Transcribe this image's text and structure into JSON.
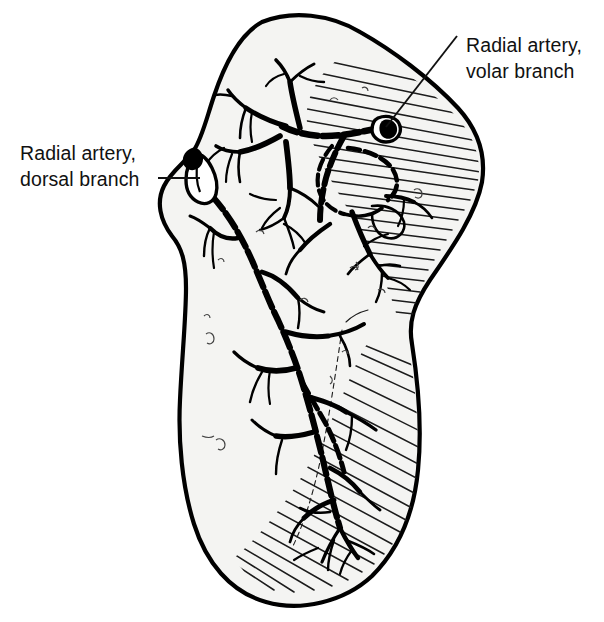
{
  "figure": {
    "kind": "anatomical-line-drawing",
    "background_color": "#ffffff",
    "ink_color": "#000000",
    "bone_fill_color": "#f4f4f2"
  },
  "labels": [
    {
      "id": "dorsal",
      "name": "radial-artery-dorsal-branch-label",
      "line1": "Radial artery,",
      "line2": "dorsal branch",
      "text_x": 20,
      "line1_y": 160,
      "line2_y": 186,
      "anchor": "start",
      "leader": "M158,178 L200,178"
    },
    {
      "id": "volar",
      "name": "radial-artery-volar-branch-label",
      "line1": "Radial artery,",
      "line2": "volar branch",
      "text_x": 466,
      "line1_y": 52,
      "line2_y": 78,
      "anchor": "start",
      "leader": "M457,36 L386,127"
    }
  ],
  "structures": [
    {
      "name": "bone-outline",
      "description": "scaphoid cortical outline"
    },
    {
      "name": "volar-hatched-region",
      "description": "hatched shading on volar/ulnar aspect"
    },
    {
      "name": "dorsal-vessel-tree",
      "description": "dorsal branch intraosseous arborization"
    },
    {
      "name": "volar-vessel-tree",
      "description": "volar branch intraosseous arborization"
    },
    {
      "name": "dorsal-artery-stub",
      "description": "cut end of radial artery dorsal branch at bone surface"
    },
    {
      "name": "volar-artery-stub",
      "description": "cut end of radial artery volar branch at bone surface"
    }
  ]
}
